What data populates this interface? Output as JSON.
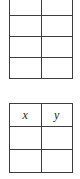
{
  "page": {
    "background_color": "#ffffff",
    "line_color": "#3d3d3d",
    "text_color": "#1d1d1d"
  },
  "tables": [
    {
      "id": "table-top",
      "name": "blank-grid-table",
      "clipped_top": true,
      "columns": 2,
      "header": null,
      "rows": [
        {
          "cells": [
            "",
            ""
          ]
        },
        {
          "cells": [
            "",
            ""
          ]
        },
        {
          "cells": [
            "",
            ""
          ]
        },
        {
          "cells": [
            "",
            ""
          ]
        }
      ]
    },
    {
      "id": "table-bottom",
      "name": "xy-table",
      "clipped_top": false,
      "columns": 2,
      "header": {
        "cells": [
          "x",
          "y"
        ]
      },
      "rows": [
        {
          "cells": [
            "",
            ""
          ]
        },
        {
          "cells": [
            "",
            ""
          ]
        }
      ]
    }
  ]
}
